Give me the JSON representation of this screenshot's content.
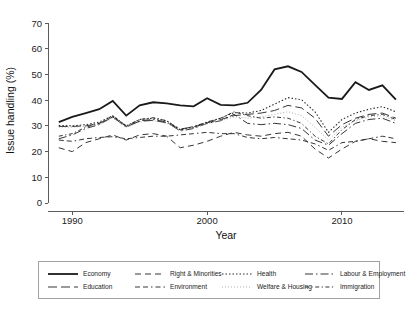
{
  "chart_data": {
    "type": "line",
    "title": "",
    "xlabel": "Year",
    "ylabel": "Issue handling (%)",
    "xlim": [
      1988.2,
      2014.6
    ],
    "ylim": [
      0,
      72
    ],
    "grid": false,
    "legend_position": "bottom",
    "y_ticks": [
      0,
      10,
      20,
      30,
      40,
      50,
      60,
      70
    ],
    "y_tick_labels": [
      "0",
      "10",
      "20",
      "30",
      "40",
      "50",
      "60",
      "70"
    ],
    "x_ticks": [
      1990,
      2000,
      2010
    ],
    "x_tick_labels": [
      "1990",
      "2000",
      "2010"
    ],
    "x": [
      1989,
      1990,
      1991,
      1992,
      1993,
      1994,
      1995,
      1996,
      1997,
      1998,
      1999,
      2000,
      2001,
      2002,
      2003,
      2004,
      2005,
      2006,
      2007,
      2008,
      2009,
      2010,
      2011,
      2012,
      2013,
      2014
    ],
    "series": [
      {
        "name": "Economy",
        "style": "solid",
        "dasharray": "none",
        "width": 1.8,
        "color": "#1a1a1a",
        "values": [
          31.5,
          33.5,
          35.0,
          36.5,
          39.7,
          34.0,
          38.0,
          39.2,
          38.8,
          38.0,
          37.6,
          40.8,
          38.2,
          38.0,
          39.0,
          44.0,
          52.0,
          53.2,
          51.0,
          46.0,
          41.0,
          40.5,
          47.0,
          44.0,
          45.8,
          40.2
        ]
      },
      {
        "name": "Right & Minorities",
        "style": "dashed",
        "dasharray": "6,4",
        "width": 0.95,
        "color": "#2b2b2b",
        "values": [
          21.5,
          20.0,
          23.5,
          25.0,
          26.5,
          24.5,
          26.5,
          27.0,
          26.0,
          21.5,
          22.5,
          24.0,
          26.0,
          27.5,
          26.5,
          26.0,
          27.0,
          27.5,
          26.0,
          21.0,
          17.5,
          21.0,
          24.0,
          25.0,
          24.0,
          23.5
        ]
      },
      {
        "name": "Health",
        "style": "dotted",
        "dasharray": "1.5,2",
        "width": 1.1,
        "color": "#2b2b2b",
        "values": [
          30.2,
          30.0,
          30.5,
          31.5,
          34.0,
          30.0,
          32.5,
          33.0,
          32.0,
          28.5,
          29.5,
          31.5,
          33.0,
          35.2,
          35.0,
          36.0,
          38.5,
          41.0,
          40.2,
          35.5,
          27.5,
          32.5,
          35.0,
          36.5,
          37.5,
          35.5
        ]
      },
      {
        "name": "Labour & Employment",
        "style": "dash-dot",
        "dasharray": "8,3,1.5,3",
        "width": 0.95,
        "color": "#2b2b2b",
        "values": [
          25.0,
          26.5,
          29.0,
          30.5,
          33.5,
          29.5,
          32.0,
          32.5,
          31.5,
          28.0,
          29.0,
          31.0,
          32.0,
          34.5,
          31.0,
          30.5,
          31.0,
          30.5,
          29.0,
          24.5,
          22.5,
          27.0,
          31.0,
          32.5,
          33.0,
          31.0
        ]
      },
      {
        "name": "Education",
        "style": "long-dash",
        "dasharray": "9,4",
        "width": 0.95,
        "color": "#2b2b2b",
        "values": [
          29.8,
          29.8,
          30.0,
          31.0,
          33.5,
          29.8,
          31.8,
          32.2,
          31.2,
          28.8,
          29.6,
          31.2,
          32.5,
          34.0,
          34.5,
          35.0,
          36.0,
          38.0,
          37.0,
          33.0,
          26.0,
          30.5,
          33.0,
          34.5,
          35.0,
          33.0
        ]
      },
      {
        "name": "Environment",
        "style": "dash-dash-dot",
        "dasharray": "5,3,5,3,1.5,3",
        "width": 0.95,
        "color": "#2b2b2b",
        "values": [
          24.5,
          24.0,
          25.0,
          25.5,
          25.8,
          25.0,
          25.5,
          26.0,
          26.0,
          26.5,
          27.0,
          27.5,
          27.0,
          27.0,
          25.5,
          25.0,
          25.5,
          25.0,
          24.5,
          23.0,
          20.5,
          23.5,
          24.0,
          25.0,
          26.0,
          25.0
        ]
      },
      {
        "name": "Welfare & Housing",
        "style": "fine-dotted",
        "dasharray": "1,2",
        "width": 0.8,
        "color": "#9a9a9a",
        "values": [
          29.5,
          29.5,
          29.8,
          30.5,
          33.0,
          29.5,
          31.5,
          32.0,
          31.0,
          28.2,
          29.2,
          30.8,
          32.0,
          33.5,
          33.0,
          33.5,
          34.5,
          35.5,
          34.0,
          29.5,
          24.5,
          29.5,
          32.0,
          33.5,
          34.0,
          32.0
        ]
      },
      {
        "name": "Immigration",
        "style": "dash-dot-dot",
        "dasharray": "4,2.5,1.2,2.5",
        "width": 0.95,
        "color": "#2b2b2b",
        "values": [
          26.0,
          27.0,
          29.5,
          31.0,
          34.0,
          30.0,
          32.5,
          33.2,
          32.0,
          28.5,
          29.8,
          31.5,
          33.0,
          35.5,
          34.0,
          33.0,
          33.5,
          33.0,
          31.0,
          26.0,
          23.0,
          28.5,
          32.5,
          34.0,
          34.5,
          32.5
        ]
      }
    ]
  },
  "legend": {
    "rows": [
      [
        "Economy",
        "Right & Minorities",
        "Health",
        "Labour & Employment"
      ],
      [
        "Education",
        "Environment",
        "Welfare & Housing",
        "Immigration"
      ]
    ]
  }
}
